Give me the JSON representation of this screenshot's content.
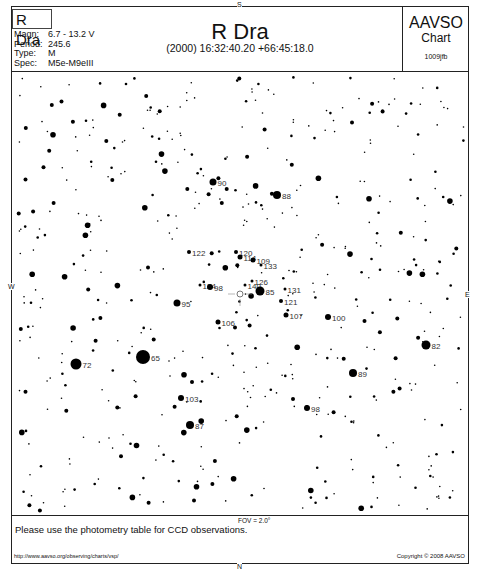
{
  "header": {
    "star_name": "R Dra",
    "info": [
      {
        "key": "Magn:",
        "value": "6.7 - 13.2 V"
      },
      {
        "key": "Period:",
        "value": "245.6"
      },
      {
        "key": "Type:",
        "value": "M"
      },
      {
        "key": "Spec:",
        "value": "M5e-M9eIII"
      }
    ],
    "title": "R Dra",
    "coordinates": "(2000) 16:32:40.20  +66:45:18.0",
    "org": "AAVSO",
    "org_sub": "Chart",
    "chart_id": "1009jfb"
  },
  "compass": {
    "top": "S",
    "bottom": "N",
    "left": "W",
    "right": "E"
  },
  "fov": "FOV = 2.0°",
  "footer": {
    "note": "Please use the photometry table for CCD observations.",
    "url": "http://www.aavso.org/observing/charts/vsp/",
    "copyright": "Copyright © 2008 AAVSO"
  },
  "comparison_stars": [
    {
      "label": "90",
      "x": 213,
      "y": 182,
      "r": 3.5
    },
    {
      "label": "88",
      "x": 277,
      "y": 195,
      "r": 4
    },
    {
      "label": "122",
      "x": 189,
      "y": 252,
      "r": 2
    },
    {
      "label": "120",
      "x": 236,
      "y": 252,
      "r": 2
    },
    {
      "label": "114",
      "x": 240,
      "y": 257,
      "r": 2.5
    },
    {
      "label": "109",
      "x": 253,
      "y": 260,
      "r": 2.5
    },
    {
      "label": "133",
      "x": 261,
      "y": 265,
      "r": 1.5
    },
    {
      "label": "126",
      "x": 252,
      "y": 281,
      "r": 1.5
    },
    {
      "label": "140",
      "x": 245,
      "y": 285,
      "r": 1.5
    },
    {
      "label": "124",
      "x": 200,
      "y": 285,
      "r": 1.5
    },
    {
      "label": "98",
      "x": 210,
      "y": 287,
      "r": 3
    },
    {
      "label": "85",
      "x": 260,
      "y": 291,
      "r": 4.5
    },
    {
      "label": "131",
      "x": 285,
      "y": 289,
      "r": 1.5
    },
    {
      "label": "121",
      "x": 281,
      "y": 301,
      "r": 2
    },
    {
      "label": "95",
      "x": 177,
      "y": 303,
      "r": 3.5
    },
    {
      "label": "107",
      "x": 286,
      "y": 315,
      "r": 2.5
    },
    {
      "label": "106",
      "x": 218,
      "y": 322,
      "r": 2.5
    },
    {
      "label": "100",
      "x": 328,
      "y": 317,
      "r": 3
    },
    {
      "label": "82",
      "x": 426,
      "y": 345,
      "r": 4.5
    },
    {
      "label": "65",
      "x": 143,
      "y": 357,
      "r": 7
    },
    {
      "label": "72",
      "x": 76,
      "y": 364,
      "r": 5.5
    },
    {
      "label": "89",
      "x": 353,
      "y": 373,
      "r": 4
    },
    {
      "label": "103",
      "x": 181,
      "y": 398,
      "r": 3
    },
    {
      "label": "98",
      "x": 307,
      "y": 408,
      "r": 3
    },
    {
      "label": "87",
      "x": 190,
      "y": 425,
      "r": 4
    }
  ],
  "variable_marker": {
    "x": 240,
    "y": 294
  }
}
